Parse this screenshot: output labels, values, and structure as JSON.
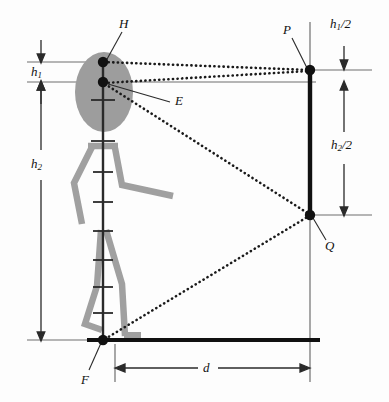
{
  "figure": {
    "labels": {
      "h_point": "H",
      "eye_point": "E",
      "foot_point": "F",
      "mirror_top_point": "P",
      "mirror_bottom_point": "Q",
      "h1": "h",
      "h1_sub": "1",
      "h2": "h",
      "h2_sub": "2",
      "h1_half_main": "h",
      "h1_half_sub": "1",
      "h1_half_tail": "/2",
      "h2_half_main": "h",
      "h2_half_sub": "2",
      "h2_half_tail": "/2",
      "distance": "d"
    },
    "colors": {
      "ink": "#111111",
      "rule": "#6f6f6f",
      "limb_gray": "#a0a0a0",
      "head_gray": "#9d9d9d",
      "background": "#fdfdfd"
    },
    "geometry": {
      "head_top_y": 62,
      "eye_y": 82,
      "ground_y": 340,
      "person_x": 103,
      "mirror_x": 310,
      "mirror_top_y": 70,
      "mirror_bottom_y": 215,
      "distance_dim_y": 368,
      "distance_left_x": 115,
      "distance_right_x": 310
    }
  }
}
